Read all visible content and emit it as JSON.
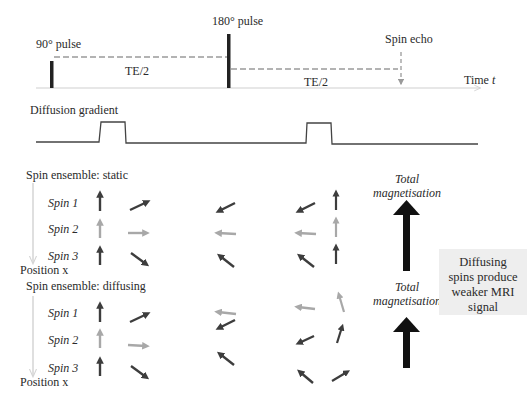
{
  "timeline": {
    "pulse_90_label": "90° pulse",
    "pulse_180_label": "180° pulse",
    "spin_echo_label": "Spin echo",
    "te_half_1": "TE/2",
    "te_half_2": "TE/2",
    "time_axis_label": "Time",
    "time_axis_var": "t"
  },
  "gradient": {
    "label": "Diffusion gradient"
  },
  "static_ensemble": {
    "title": "Spin ensemble: static",
    "spins": [
      "Spin 1",
      "Spin 2",
      "Spin 3"
    ],
    "position_label": "Position x",
    "total_label_line1": "Total",
    "total_label_line2": "magnetisation"
  },
  "diffusing_ensemble": {
    "title": "Spin ensemble: diffusing",
    "spins": [
      "Spin 1",
      "Spin 2",
      "Spin 3"
    ],
    "position_label": "Position x",
    "total_label_line1": "Total",
    "total_label_line2": "magnetisation"
  },
  "conclusion_box": {
    "line1": "Diffusing",
    "line2": "spins produce",
    "line3": "weaker MRI",
    "line4": "signal"
  },
  "colors": {
    "dark_arrow": "#3d3d3d",
    "light_arrow": "#a8a8a8",
    "dashed_line": "#9a9a9a",
    "axis_line": "#cfcfcf",
    "box_bg": "#eeeeee"
  }
}
